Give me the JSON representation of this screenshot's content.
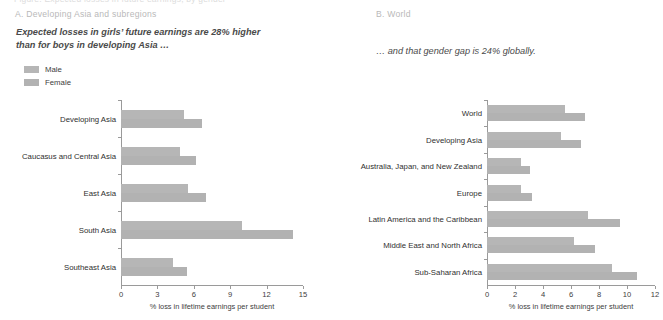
{
  "figure": {
    "cut_off_header": "Figure: Expected losses in future earnings, by gender",
    "legend": [
      {
        "key": "male",
        "label": "Male",
        "color": "#b6b6b6"
      },
      {
        "key": "female",
        "label": "Female",
        "color": "#b2b2b2"
      }
    ],
    "axis_title": "% loss in lifetime earnings per student"
  },
  "panels": [
    {
      "label": "A. Developing Asia and subregions",
      "subtitle": "Expected losses in girls’ future earnings are 28% higher\nthan for boys in developing Asia …"
    },
    {
      "label": "B. World",
      "subtitle": "… and that gender gap is 24% globally."
    }
  ],
  "chart_data": [
    {
      "type": "bar",
      "orientation": "horizontal",
      "title": "A. Developing Asia and subregions",
      "subtitle": "Expected losses in girls’ future earnings are 28% higher than for boys in developing Asia …",
      "xlabel": "% loss in lifetime earnings per student",
      "ylabel": "",
      "xlim": [
        0,
        15
      ],
      "xticks": [
        0,
        3,
        6,
        9,
        12,
        15
      ],
      "grid": false,
      "legend": [
        "Male",
        "Female"
      ],
      "legend_position": "top-left",
      "categories": [
        "Developing Asia",
        "Caucasus and Central Asia",
        "East Asia",
        "South Asia",
        "Southeast Asia"
      ],
      "series": [
        {
          "name": "Male",
          "values": [
            5.2,
            4.9,
            5.5,
            10.0,
            4.3
          ]
        },
        {
          "name": "Female",
          "values": [
            6.7,
            6.2,
            7.0,
            14.2,
            5.4
          ]
        }
      ]
    },
    {
      "type": "bar",
      "orientation": "horizontal",
      "title": "B. World",
      "subtitle": "… and that gender gap is 24% globally.",
      "xlabel": "% loss in lifetime earnings per student",
      "ylabel": "",
      "xlim": [
        0,
        12
      ],
      "xticks": [
        0,
        2,
        4,
        6,
        8,
        10,
        12
      ],
      "grid": false,
      "legend": [
        "Male",
        "Female"
      ],
      "legend_position": "none",
      "categories": [
        "World",
        "Developing Asia",
        "Australia, Japan, and New Zealand",
        "Europe",
        "Latin America and the Caribbean",
        "Middle East and North Africa",
        "Sub-Saharan Africa"
      ],
      "series": [
        {
          "name": "Male",
          "values": [
            5.6,
            5.3,
            2.4,
            2.4,
            7.2,
            6.2,
            8.9
          ]
        },
        {
          "name": "Female",
          "values": [
            7.0,
            6.7,
            3.1,
            3.2,
            9.5,
            7.7,
            10.7
          ]
        }
      ]
    }
  ]
}
